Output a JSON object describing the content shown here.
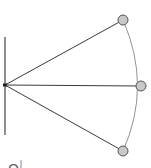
{
  "diagram": {
    "type": "pendulum-swing",
    "colors": {
      "line": "#3a3a3a",
      "wall": "#6a6a6a",
      "arc": "#777777",
      "bob_fill": "#c8c8c8",
      "bob_stroke": "#555555",
      "pivot": "#222222"
    },
    "wall": {
      "x": 5,
      "y1": 37,
      "y2": 135
    },
    "pivot": {
      "x": 5,
      "y": 85
    },
    "bobs": [
      {
        "name": "top",
        "x": 123,
        "y": 20,
        "r": 5
      },
      {
        "name": "middle",
        "x": 141,
        "y": 86,
        "r": 5
      },
      {
        "name": "bottom",
        "x": 123,
        "y": 151,
        "r": 5
      }
    ],
    "cut_label": "Q"
  }
}
